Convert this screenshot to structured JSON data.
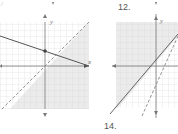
{
  "problems": [
    {
      "number": "",
      "axis_x_label": "x",
      "axis_y_label": "y"
    },
    {
      "number": "12.",
      "axis_x_label": "x",
      "axis_y_label": "y"
    }
  ],
  "next_problem": {
    "number": "14."
  },
  "colors": {
    "grid": "#c9c9c9",
    "shade": "#ececec",
    "axis": "#777777",
    "line": "#666666"
  }
}
